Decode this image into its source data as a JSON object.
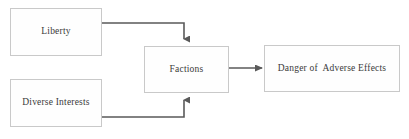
{
  "diagram": {
    "background_color": "#ffffff",
    "node_fill_color": "#fefefe",
    "node_border_color": "#c9c9c9",
    "text_color": "#3a3a3a",
    "connector_color": "#5a5a5a",
    "nodes": [
      {
        "id": "liberty",
        "label": "Liberty"
      },
      {
        "id": "diverse",
        "label": "Diverse Interests"
      },
      {
        "id": "factions",
        "label": "Factions"
      },
      {
        "id": "danger",
        "label": "Danger of  Adverse Effects"
      }
    ],
    "connectors": [
      {
        "id": "liberty-to-factions",
        "from": "liberty",
        "to": "factions",
        "style": "elbow",
        "arrowhead": "down"
      },
      {
        "id": "diverse-to-factions",
        "from": "diverse",
        "to": "factions",
        "style": "elbow",
        "arrowhead": "up"
      },
      {
        "id": "factions-to-danger",
        "from": "factions",
        "to": "danger",
        "style": "straight",
        "arrowhead": "right"
      }
    ]
  }
}
